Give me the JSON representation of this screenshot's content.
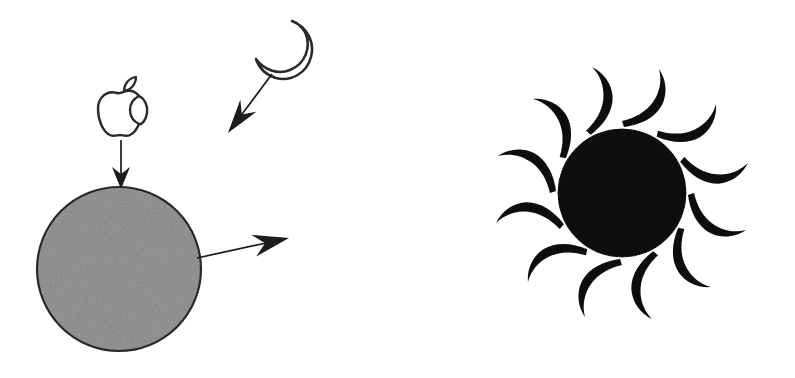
{
  "figure": {
    "background_color": "#ffffff",
    "width": 795,
    "height": 378,
    "ink_color": "#1a1a1a",
    "panels": [
      {
        "id": "left-panel",
        "name": "planet-with-inputs",
        "elements": [
          {
            "name": "apple-logo",
            "kind": "outline-glyph",
            "label": "Apple logo",
            "stroke_color": "#2b2b2b",
            "fill": "none",
            "center_x": 121,
            "center_y": 112,
            "width": 44,
            "height": 52
          },
          {
            "name": "crescent-moon",
            "kind": "outline-glyph",
            "label": "Crescent moon",
            "stroke_color": "#2b2b2b",
            "fill": "none",
            "center_x": 283,
            "center_y": 51,
            "width": 60,
            "height": 62
          },
          {
            "name": "apple-down-arrow",
            "kind": "arrow",
            "label": "Arrow from apple to planet",
            "color": "#1a1a1a",
            "from_x": 121,
            "from_y": 140,
            "to_x": 121,
            "to_y": 189
          },
          {
            "name": "moon-diagonal-arrow",
            "kind": "arrow",
            "label": "Arrow from moon toward planet",
            "color": "#1a1a1a",
            "from_x": 272,
            "from_y": 74,
            "to_x": 228,
            "to_y": 133
          },
          {
            "name": "planet-circle",
            "kind": "circle",
            "label": "Shaded gray planet",
            "fill_color": "#999999",
            "stroke_color": "#2b2b2b",
            "center_x": 119,
            "center_y": 269,
            "radius": 82,
            "texture": "grain"
          },
          {
            "name": "planet-output-arrow",
            "kind": "arrow",
            "label": "Arrow out of planet to the right",
            "color": "#1a1a1a",
            "from_x": 197,
            "from_y": 258,
            "to_x": 289,
            "to_y": 238
          }
        ]
      },
      {
        "id": "right-panel",
        "name": "radiant-sun",
        "elements": [
          {
            "name": "sun-disc",
            "kind": "circle",
            "label": "Solid black sun disc",
            "fill_color": "#0d0d0d",
            "stroke_color": "#0d0d0d",
            "center_x": 622,
            "center_y": 193,
            "radius": 64,
            "texture": "grain"
          },
          {
            "name": "sun-rays",
            "kind": "ray-ring",
            "label": "Twelve S-curved flame rays",
            "color": "#0d0d0d",
            "count": 12,
            "inner_radius": 72,
            "outer_radius": 136,
            "angles_deg": [
              0,
              30,
              60,
              90,
              120,
              150,
              180,
              210,
              240,
              270,
              300,
              330
            ]
          }
        ]
      }
    ]
  }
}
